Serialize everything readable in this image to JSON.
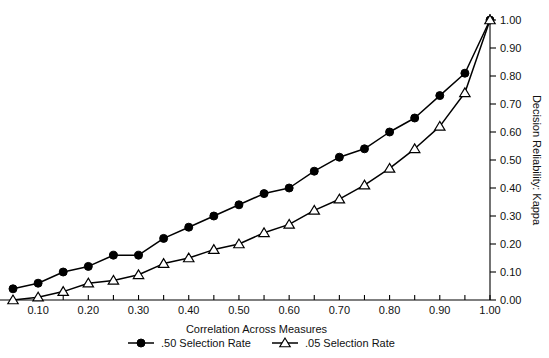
{
  "chart_data": {
    "type": "line",
    "title": "",
    "xlabel": "Correlation Across Measures",
    "ylabel": "Decision Reliability: Kappa",
    "xlim": [
      0.0,
      1.0
    ],
    "ylim": [
      0.0,
      1.0
    ],
    "grid": false,
    "legend_position": "bottom",
    "x_tick_labels": [
      "0.10",
      "0.20",
      "0.30",
      "0.40",
      "0.50",
      "0.60",
      "0.70",
      "0.80",
      "0.90",
      "1.00"
    ],
    "x_tick_values": [
      0.1,
      0.2,
      0.3,
      0.4,
      0.5,
      0.6,
      0.7,
      0.8,
      0.9,
      1.0
    ],
    "x_minor_tick_values": [
      0.05,
      0.15,
      0.25,
      0.35,
      0.45,
      0.55,
      0.65,
      0.75,
      0.85,
      0.95
    ],
    "y_tick_labels": [
      "0.00",
      "0.10",
      "0.20",
      "0.30",
      "0.40",
      "0.50",
      "0.60",
      "0.70",
      "0.80",
      "0.90",
      "1.00"
    ],
    "y_tick_values": [
      0.0,
      0.1,
      0.2,
      0.3,
      0.4,
      0.5,
      0.6,
      0.7,
      0.8,
      0.9,
      1.0
    ],
    "y_axis_side": "right",
    "x": [
      0.05,
      0.1,
      0.15,
      0.2,
      0.25,
      0.3,
      0.35,
      0.4,
      0.45,
      0.5,
      0.55,
      0.6,
      0.65,
      0.7,
      0.75,
      0.8,
      0.85,
      0.9,
      0.95,
      1.0
    ],
    "series": [
      {
        "name": ".50 Selection Rate",
        "marker": "filled-circle",
        "color": "#000000",
        "values": [
          0.04,
          0.06,
          0.1,
          0.12,
          0.16,
          0.16,
          0.22,
          0.26,
          0.3,
          0.34,
          0.38,
          0.4,
          0.46,
          0.51,
          0.54,
          0.6,
          0.65,
          0.73,
          0.81,
          1.0
        ]
      },
      {
        "name": ".05 Selection Rate",
        "marker": "open-triangle",
        "color": "#000000",
        "values": [
          0.0,
          0.01,
          0.03,
          0.06,
          0.07,
          0.09,
          0.13,
          0.15,
          0.18,
          0.2,
          0.24,
          0.27,
          0.32,
          0.36,
          0.41,
          0.47,
          0.54,
          0.62,
          0.74,
          1.0
        ]
      }
    ]
  },
  "legend": {
    "entries": [
      {
        "label": ".50 Selection Rate",
        "marker": "filled-circle"
      },
      {
        "label": ".05 Selection Rate",
        "marker": "open-triangle"
      }
    ]
  },
  "axis": {
    "x_title": "Correlation Across Measures",
    "y_title": "Decision Reliability: Kappa"
  }
}
